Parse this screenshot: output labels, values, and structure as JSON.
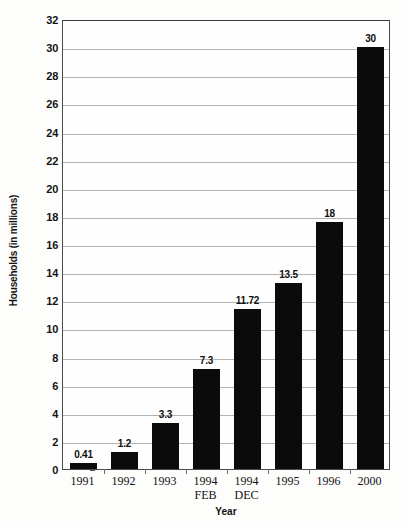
{
  "chart_data": {
    "type": "bar",
    "title": "",
    "xlabel": "Year",
    "ylabel": "Households (in millions)",
    "categories": [
      "1991",
      "1992",
      "1993",
      "1994 FEB",
      "1994 DEC",
      "1995",
      "1996",
      "2000"
    ],
    "category_lines": [
      [
        "1991",
        ""
      ],
      [
        "1992",
        ""
      ],
      [
        "1993",
        ""
      ],
      [
        "1994",
        "FEB"
      ],
      [
        "1994",
        "DEC"
      ],
      [
        "1995",
        ""
      ],
      [
        "1996",
        ""
      ],
      [
        "2000",
        ""
      ]
    ],
    "values": [
      0.41,
      1.2,
      3.3,
      7.3,
      11.72,
      13.5,
      18,
      30
    ],
    "value_labels": [
      "0.41",
      "1.2",
      "3.3",
      "7.3",
      "11.72",
      "13.5",
      "18",
      "30"
    ],
    "bar_tops": [
      0.41,
      1.2,
      3.3,
      7.1,
      11.4,
      13.2,
      17.6,
      30
    ],
    "ylim": [
      0,
      32
    ],
    "ytick_step": 2,
    "yticks": [
      0,
      2,
      4,
      6,
      8,
      10,
      12,
      14,
      16,
      18,
      20,
      22,
      24,
      26,
      28,
      30,
      32
    ],
    "ytick_labels": [
      "0",
      "2",
      "4",
      "6",
      "8",
      "10",
      "12",
      "14",
      "16",
      "18",
      "20",
      "22",
      "24",
      "26",
      "28",
      "30",
      "32"
    ],
    "grid": true,
    "legend": false,
    "bar_color": "#0b0b0b",
    "gridline_color": "#b4b4b4",
    "axis_color": "#4a4a4a",
    "background_color": "#fdfdfb"
  }
}
